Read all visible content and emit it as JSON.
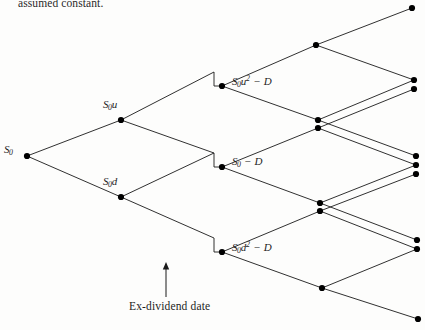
{
  "figure": {
    "kind": "binomial-tree-diagram",
    "top_text": "assumed constant.",
    "caption": "Ex-dividend date",
    "colors": {
      "line": "#1a1a1a",
      "node": "#000000",
      "text": "#1d1d1d",
      "background": "#fdfdfc"
    },
    "nodes": [
      {
        "id": "n0",
        "x": 27,
        "y": 156,
        "label_html": "S<sub>0</sub>",
        "label_x": 4,
        "label_y": 143,
        "has_label": true
      },
      {
        "id": "nu",
        "x": 121,
        "y": 120,
        "label_html": "S<sub>0</sub>u",
        "label_x": 103,
        "label_y": 98,
        "has_label": true
      },
      {
        "id": "nd",
        "x": 121,
        "y": 197,
        "label_html": "S<sub>0</sub>d",
        "label_x": 103,
        "label_y": 175,
        "has_label": true
      },
      {
        "id": "m1",
        "x": 222,
        "y": 86,
        "label_html": "S<sub>0</sub>u<sup>2</sup> &minus; D",
        "label_x": 232,
        "label_y": 74,
        "has_label": true
      },
      {
        "id": "m2",
        "x": 222,
        "y": 167,
        "label_html": "S<sub>0</sub> &minus; D",
        "label_x": 232,
        "label_y": 155,
        "has_label": true
      },
      {
        "id": "m3",
        "x": 222,
        "y": 252,
        "label_html": "S<sub>0</sub>d<sup>2</sup> &minus; D",
        "label_x": 232,
        "label_y": 240,
        "has_label": true
      },
      {
        "id": "p1",
        "x": 316,
        "y": 45,
        "has_label": false
      },
      {
        "id": "p2a",
        "x": 318,
        "y": 120,
        "has_label": false
      },
      {
        "id": "p2b",
        "x": 318,
        "y": 128,
        "has_label": false
      },
      {
        "id": "p3a",
        "x": 320,
        "y": 203,
        "has_label": false
      },
      {
        "id": "p3b",
        "x": 320,
        "y": 211,
        "has_label": false
      },
      {
        "id": "p4",
        "x": 322,
        "y": 288,
        "has_label": false
      },
      {
        "id": "t1",
        "x": 412,
        "y": 8,
        "has_label": false
      },
      {
        "id": "t2",
        "x": 414,
        "y": 80,
        "has_label": false
      },
      {
        "id": "t3",
        "x": 414,
        "y": 89,
        "has_label": false
      },
      {
        "id": "t4",
        "x": 416,
        "y": 156,
        "has_label": false
      },
      {
        "id": "t5",
        "x": 416,
        "y": 165,
        "has_label": false
      },
      {
        "id": "t6",
        "x": 416,
        "y": 174,
        "has_label": false
      },
      {
        "id": "t7",
        "x": 417,
        "y": 240,
        "has_label": false
      },
      {
        "id": "t8",
        "x": 417,
        "y": 249,
        "has_label": false
      },
      {
        "id": "t9",
        "x": 418,
        "y": 319,
        "has_label": false
      }
    ],
    "step_drops": [
      {
        "id": "drop-u",
        "from_x": 214,
        "from_y": 72,
        "to_x": 214,
        "to_y": 86
      },
      {
        "id": "drop-m",
        "from_x": 214,
        "from_y": 153,
        "to_x": 214,
        "to_y": 167
      },
      {
        "id": "drop-d",
        "from_x": 214,
        "from_y": 238,
        "to_x": 214,
        "to_y": 252
      }
    ],
    "edges": [
      {
        "id": "e-root-up",
        "x1": 27,
        "y1": 156,
        "x2": 121,
        "y2": 120
      },
      {
        "id": "e-root-down",
        "x1": 27,
        "y1": 156,
        "x2": 121,
        "y2": 197
      },
      {
        "id": "e-u-up",
        "x1": 121,
        "y1": 120,
        "x2": 214,
        "y2": 72
      },
      {
        "id": "e-u-down",
        "x1": 121,
        "y1": 120,
        "x2": 214,
        "y2": 153
      },
      {
        "id": "e-d-up",
        "x1": 121,
        "y1": 197,
        "x2": 214,
        "y2": 153
      },
      {
        "id": "e-d-down",
        "x1": 121,
        "y1": 197,
        "x2": 214,
        "y2": 238
      },
      {
        "id": "e-m1-up",
        "x1": 222,
        "y1": 86,
        "x2": 316,
        "y2": 45
      },
      {
        "id": "e-m1-down",
        "x1": 222,
        "y1": 86,
        "x2": 318,
        "y2": 120
      },
      {
        "id": "e-m2-up",
        "x1": 222,
        "y1": 167,
        "x2": 318,
        "y2": 128
      },
      {
        "id": "e-m2-down",
        "x1": 222,
        "y1": 167,
        "x2": 320,
        "y2": 203
      },
      {
        "id": "e-m3-up",
        "x1": 222,
        "y1": 252,
        "x2": 320,
        "y2": 211
      },
      {
        "id": "e-m3-down",
        "x1": 222,
        "y1": 252,
        "x2": 322,
        "y2": 288
      },
      {
        "id": "e-p1-up",
        "x1": 316,
        "y1": 45,
        "x2": 412,
        "y2": 8
      },
      {
        "id": "e-p1-down",
        "x1": 316,
        "y1": 45,
        "x2": 414,
        "y2": 80
      },
      {
        "id": "e-p2a-up",
        "x1": 318,
        "y1": 120,
        "x2": 414,
        "y2": 80
      },
      {
        "id": "e-p2a-down",
        "x1": 318,
        "y1": 120,
        "x2": 416,
        "y2": 156
      },
      {
        "id": "e-p2b-up",
        "x1": 318,
        "y1": 128,
        "x2": 414,
        "y2": 89
      },
      {
        "id": "e-p2b-down",
        "x1": 318,
        "y1": 128,
        "x2": 416,
        "y2": 165
      },
      {
        "id": "e-p3a-up",
        "x1": 320,
        "y1": 203,
        "x2": 416,
        "y2": 165
      },
      {
        "id": "e-p3a-down",
        "x1": 320,
        "y1": 203,
        "x2": 417,
        "y2": 240
      },
      {
        "id": "e-p3b-up",
        "x1": 320,
        "y1": 211,
        "x2": 416,
        "y2": 174
      },
      {
        "id": "e-p3b-down",
        "x1": 320,
        "y1": 211,
        "x2": 417,
        "y2": 249
      },
      {
        "id": "e-p4-up",
        "x1": 322,
        "y1": 288,
        "x2": 417,
        "y2": 249
      },
      {
        "id": "e-p4-down",
        "x1": 322,
        "y1": 288,
        "x2": 418,
        "y2": 319
      }
    ],
    "arrow": {
      "x": 166,
      "y_top": 262,
      "y_bottom": 297
    },
    "caption_pos": {
      "x": 129,
      "y": 300
    },
    "top_text_pos": {
      "x": 18,
      "y": -3
    }
  }
}
